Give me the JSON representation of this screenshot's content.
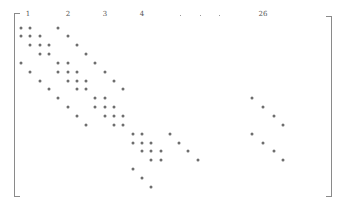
{
  "diagram": {
    "type": "sparse-matrix-pattern",
    "bracket_color": "#8a8a8a",
    "dot_color": "#6e6e6e",
    "column_labels": [
      {
        "text": "1",
        "x": 28
      },
      {
        "text": "2",
        "x": 68
      },
      {
        "text": "3",
        "x": 105
      },
      {
        "text": "4",
        "x": 142
      },
      {
        "text": "26",
        "x": 263
      }
    ],
    "ellipsis_x": [
      180,
      200,
      219
    ],
    "grid": {
      "x0": 21,
      "dx": 9.3,
      "y0": 27.5,
      "dy": 8.85
    },
    "rows": [
      [
        0,
        1,
        4
      ],
      [
        0,
        1,
        2,
        5
      ],
      [
        1,
        2,
        3,
        6
      ],
      [
        2,
        3,
        7
      ],
      [
        0,
        4,
        5,
        8
      ],
      [
        1,
        4,
        5,
        6,
        9
      ],
      [
        2,
        5,
        6,
        7,
        10
      ],
      [
        3,
        6,
        7,
        11
      ],
      [
        4,
        8,
        9,
        24.8
      ],
      [
        5,
        8,
        9,
        10,
        26
      ],
      [
        6,
        9,
        10,
        11,
        27.2
      ],
      [
        7,
        10,
        11,
        28.2
      ],
      [
        12,
        13,
        16,
        24.8
      ],
      [
        12,
        13,
        14,
        17,
        26
      ],
      [
        13,
        14,
        15,
        18,
        27.2
      ],
      [
        14,
        15,
        19,
        28.2
      ],
      [
        12
      ],
      [
        13
      ],
      [
        14
      ]
    ]
  }
}
